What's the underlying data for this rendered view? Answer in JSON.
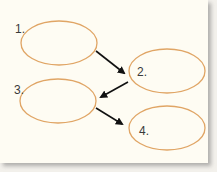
{
  "diagram": {
    "type": "sequence-flow",
    "background_color": "#fefcf3",
    "oval_stroke_color": "#e0a565",
    "arrow_color": "#111111",
    "steps": [
      {
        "label": "1.",
        "text": "",
        "cx": 59,
        "cy": 43,
        "rx": 38,
        "ry": 22,
        "label_x": 15,
        "label_y": 33
      },
      {
        "label": "2.",
        "text": "",
        "cx": 167,
        "cy": 71,
        "rx": 38,
        "ry": 22,
        "label_x": 137,
        "label_y": 76
      },
      {
        "label": "3.",
        "text": "",
        "cx": 58,
        "cy": 101,
        "rx": 38,
        "ry": 22,
        "label_x": 14,
        "label_y": 94
      },
      {
        "label": "4.",
        "text": "",
        "cx": 167,
        "cy": 128,
        "rx": 38,
        "ry": 22,
        "label_x": 139,
        "label_y": 135
      }
    ],
    "arrows": [
      {
        "from": "1.",
        "to": "2."
      },
      {
        "from": "2.",
        "to": "3."
      },
      {
        "from": "3.",
        "to": "4."
      }
    ]
  }
}
